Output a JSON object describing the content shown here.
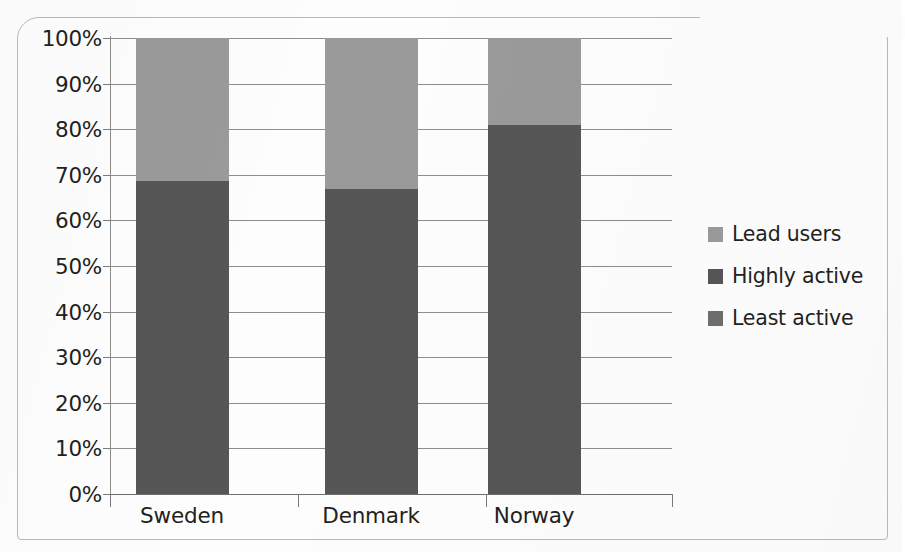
{
  "chart_data": {
    "type": "bar",
    "subtype": "stacked-100-percent",
    "title": "",
    "xlabel": "",
    "ylabel": "",
    "categories": [
      "Sweden",
      "Denmark",
      "Norway"
    ],
    "series": [
      {
        "name": "Least active",
        "values": [
          68.7,
          66.8,
          81.0
        ],
        "color": "#565656"
      },
      {
        "name": "Lead users",
        "values": [
          31.3,
          33.2,
          19.0
        ],
        "color": "#9a9a9a"
      }
    ],
    "legend_entries": [
      {
        "label": "Lead users",
        "color": "#9a9a9a"
      },
      {
        "label": "Highly active",
        "color": "#565656"
      },
      {
        "label": "Least active",
        "color": "#6e6e6e"
      }
    ],
    "legend_position": "right",
    "ylim": [
      0,
      100
    ],
    "yticks": [
      0,
      10,
      20,
      30,
      40,
      50,
      60,
      70,
      80,
      90,
      100
    ],
    "ytick_labels": [
      "0%",
      "10%",
      "20%",
      "30%",
      "40%",
      "50%",
      "60%",
      "70%",
      "80%",
      "90%",
      "100%"
    ],
    "grid": true,
    "grid_axis": "y",
    "bar_stack_order_bottom_to_top": [
      "Least active",
      "Lead users"
    ]
  },
  "axis": {
    "y": {
      "labels": [
        "100%",
        "90%",
        "80%",
        "70%",
        "60%",
        "50%",
        "40%",
        "30%",
        "20%",
        "10%",
        "0%"
      ]
    },
    "x": {
      "labels": [
        "Sweden",
        "Denmark",
        "Norway"
      ]
    }
  },
  "legend": {
    "items": [
      {
        "label": "Lead users"
      },
      {
        "label": "Highly active"
      },
      {
        "label": "Least active"
      }
    ]
  },
  "colors": {
    "light_gray": "#9a9a9a",
    "mid_gray": "#6e6e6e",
    "dark_gray": "#565656",
    "gridline": "#8d8d8d",
    "text": "#231f20",
    "frame": "#b9b9b9",
    "background": "#fdfdfd"
  }
}
